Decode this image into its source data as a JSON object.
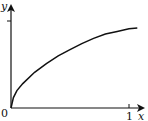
{
  "chart_data": {
    "type": "line",
    "title": "",
    "xlabel": "x",
    "ylabel": "y",
    "origin_label": "0",
    "x_ticks": [
      {
        "value": 1,
        "label": "1"
      }
    ],
    "y_ticks": [
      {
        "value": 1,
        "label": ""
      }
    ],
    "xlim": [
      0,
      1.15
    ],
    "ylim": [
      0,
      1.2
    ],
    "grid": false,
    "legend": "none",
    "series": [
      {
        "name": "curve",
        "color": "#111111",
        "x": [
          0,
          0.02,
          0.05,
          0.1,
          0.2,
          0.3,
          0.4,
          0.5,
          0.6,
          0.7,
          0.8,
          0.9,
          1.0,
          1.07
        ],
        "y": [
          0,
          0.12,
          0.2,
          0.28,
          0.41,
          0.51,
          0.6,
          0.67,
          0.74,
          0.8,
          0.85,
          0.88,
          0.91,
          0.92
        ]
      }
    ]
  }
}
